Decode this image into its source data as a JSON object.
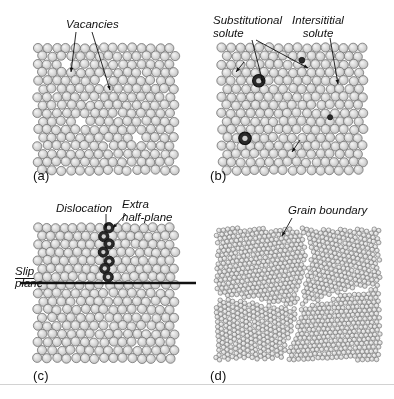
{
  "figure": {
    "width": 394,
    "height": 399,
    "background": "#ffffff",
    "rule_color": "#d2d2d2",
    "atom": {
      "fill": "#d9d9d9",
      "highlight": "#f2f2f2",
      "stroke": "#6e6e6e",
      "solute_fill": "#2a2a2a",
      "solute_stroke": "#111111"
    },
    "line_color": "#111111"
  },
  "panels": [
    {
      "id": "vacancies",
      "letter": "(a)",
      "letter_x": 33,
      "letter_y": 168,
      "lattice": {
        "x": 38,
        "y": 48,
        "w": 132,
        "h": 117,
        "radius": 4.6,
        "dx": 9.4,
        "dy": 8.15,
        "rotation": 0,
        "style": "rows",
        "jitter": 0.18
      },
      "vacancies": [
        {
          "col": 3,
          "row": 2
        },
        {
          "col": 7,
          "row": 4
        },
        {
          "col": 4,
          "row": 9
        },
        {
          "col": 10,
          "row": 11
        }
      ],
      "callouts": [
        {
          "name": "vacancies-label",
          "text": "Vacancies",
          "x": 66,
          "y": 18,
          "align": "left",
          "italic": true
        }
      ],
      "leaders": [
        {
          "name": "vacancy-leader-left",
          "x1": 76,
          "y1": 32,
          "x2": 71,
          "y2": 72,
          "arrow": true
        },
        {
          "name": "vacancy-leader-right",
          "x1": 92,
          "y1": 32,
          "x2": 110,
          "y2": 90,
          "arrow": true
        }
      ]
    },
    {
      "id": "solutes",
      "letter": "(b)",
      "letter_x": 210,
      "letter_y": 168,
      "lattice": {
        "x": 222,
        "y": 48,
        "w": 136,
        "h": 117,
        "radius": 4.6,
        "dx": 9.4,
        "dy": 8.15,
        "rotation": 0,
        "style": "rows",
        "jitter": 0.18
      },
      "substitutional": [
        {
          "col": 4,
          "row": 4,
          "r": 6.2
        },
        {
          "col": 2,
          "row": 11,
          "r": 6.2
        }
      ],
      "interstitial": [
        {
          "col": 8,
          "row": 1,
          "r": 2.9
        },
        {
          "col": 11,
          "row": 8,
          "r": 2.6
        }
      ],
      "callouts": [
        {
          "name": "substitutional-solute-label",
          "text": "Substitutional\nsolute",
          "x": 213,
          "y": 14,
          "align": "left",
          "italic": true
        },
        {
          "name": "interstitial-solute-label",
          "text": "Intersititial\nsolute",
          "x": 318,
          "y": 14,
          "align": "center",
          "italic": true
        }
      ],
      "leaders": [
        {
          "name": "substitutional-leader-a",
          "x1": 252,
          "y1": 40,
          "x2": 263,
          "y2": 83,
          "arrow": true
        },
        {
          "name": "substitutional-leader-b",
          "x1": 256,
          "y1": 40,
          "x2": 308,
          "y2": 68,
          "arrow": true
        },
        {
          "name": "interstitial-leader-a",
          "x1": 330,
          "y1": 38,
          "x2": 338,
          "y2": 84,
          "arrow": true
        },
        {
          "name": "interstitial-leader-b",
          "x1": 244,
          "y1": 62,
          "x2": 236,
          "y2": 72,
          "arrow": true
        },
        {
          "name": "interstitial-leader-c",
          "x1": 300,
          "y1": 140,
          "x2": 292,
          "y2": 152,
          "arrow": true
        }
      ]
    },
    {
      "id": "dislocation",
      "letter": "(c)",
      "letter_x": 33,
      "letter_y": 368,
      "lattice": {
        "x": 38,
        "y": 228,
        "w": 132,
        "h": 130,
        "radius": 4.6,
        "dx": 9.4,
        "dy": 8.15,
        "rotation": 0,
        "style": "dislocation",
        "jitter": 0.18,
        "half_plane_col": 7,
        "slip_row": 6
      },
      "half_plane_atoms": 6,
      "slip_plane": {
        "x1": 20,
        "y1": 283,
        "x2": 196,
        "y2": 283,
        "width": 2.4
      },
      "callouts": [
        {
          "name": "dislocation-label",
          "text": "Dislocation",
          "x": 56,
          "y": 202,
          "align": "left",
          "italic": true
        },
        {
          "name": "extra-half-plane-label",
          "text": "Extra\nhalf-plane",
          "x": 122,
          "y": 198,
          "align": "left",
          "italic": true
        },
        {
          "name": "slip-plane-label",
          "text": "Slip",
          "x": 15,
          "y": 265,
          "align": "left",
          "italic": true,
          "underline": true
        },
        {
          "name": "slip-plane-label-2",
          "text": "plane",
          "x": 15,
          "y": 277,
          "align": "left",
          "italic": true
        }
      ],
      "leaders": [
        {
          "name": "dislocation-leader",
          "x1": 106,
          "y1": 214,
          "x2": 106,
          "y2": 228,
          "arrow": true
        },
        {
          "name": "extra-half-plane-leader",
          "x1": 126,
          "y1": 214,
          "x2": 113,
          "y2": 228,
          "arrow": true
        }
      ]
    },
    {
      "id": "grain-boundary",
      "letter": "(d)",
      "letter_x": 210,
      "letter_y": 368,
      "lattice": {
        "x": 216,
        "y": 228,
        "w": 164,
        "h": 132,
        "radius": 2.3,
        "dx": 4.7,
        "dy": 4.1,
        "rotation": 0,
        "style": "grains",
        "jitter": 0.22
      },
      "grains": [
        {
          "name": "grain-upper-left",
          "rotation": -8,
          "cx": 0.26,
          "cy": 0.26
        },
        {
          "name": "grain-upper-right",
          "rotation": 14,
          "cx": 0.74,
          "cy": 0.26
        },
        {
          "name": "grain-lower-left",
          "rotation": 26,
          "cx": 0.26,
          "cy": 0.76
        },
        {
          "name": "grain-lower-right",
          "rotation": -3,
          "cx": 0.74,
          "cy": 0.76
        }
      ],
      "callouts": [
        {
          "name": "grain-boundary-label",
          "text": "Grain boundary",
          "x": 288,
          "y": 204,
          "align": "left",
          "italic": true
        }
      ],
      "leaders": [
        {
          "name": "grain-boundary-leader",
          "x1": 292,
          "y1": 218,
          "x2": 282,
          "y2": 236,
          "arrow": true
        }
      ]
    }
  ]
}
